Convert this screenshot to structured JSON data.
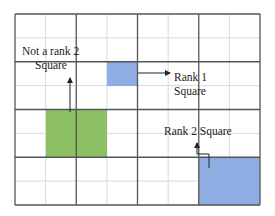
{
  "diagram": {
    "grid": {
      "major_cols": 4,
      "major_rows": 4,
      "minor_subdivisions": 2
    },
    "colors": {
      "major_line": "#555555",
      "minor_line": "#d8d8d8",
      "green_square": "#8cc063",
      "blue_square": "#8eaee3",
      "text": "#222222"
    },
    "labels": {
      "not_rank2_line1": "Not a rank 2",
      "not_rank2_line2": "Square",
      "rank1_line1": "Rank 1",
      "rank1_line2": "Square",
      "rank2": "Rank 2 Square"
    },
    "regions": [
      {
        "name": "not-rank-2-square",
        "color_key": "green_square",
        "description": "Green square spanning half-cells, not aligned to major grid"
      },
      {
        "name": "rank-1-square",
        "color_key": "blue_square",
        "description": "Small blue square one minor cell"
      },
      {
        "name": "rank-2-square",
        "color_key": "blue_square",
        "description": "Large blue square one major cell"
      }
    ]
  }
}
